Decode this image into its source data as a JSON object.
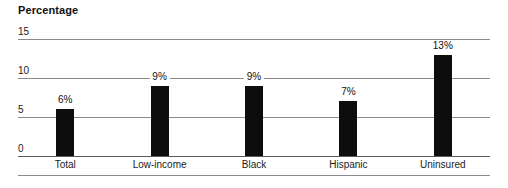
{
  "chart_data": {
    "type": "bar",
    "title": "Percentage",
    "xlabel": "",
    "ylabel": "",
    "categories": [
      "Total",
      "Low-income",
      "Black",
      "Hispanic",
      "Uninsured"
    ],
    "values": [
      6,
      9,
      9,
      7,
      13
    ],
    "data_labels": [
      "6%",
      "9%",
      "9%",
      "7%",
      "13%"
    ],
    "ylim": [
      0,
      15
    ],
    "yticks": [
      0,
      5,
      10,
      15
    ],
    "ytick_labels": [
      "0",
      "5",
      "10",
      "15"
    ],
    "grid": true,
    "legend": false,
    "legend_position": "none",
    "bar_color": "#0d0d0d",
    "gridline_color": "#8b8b8b",
    "background_color": "#ffffff",
    "text_color": "#1a1a1a"
  }
}
